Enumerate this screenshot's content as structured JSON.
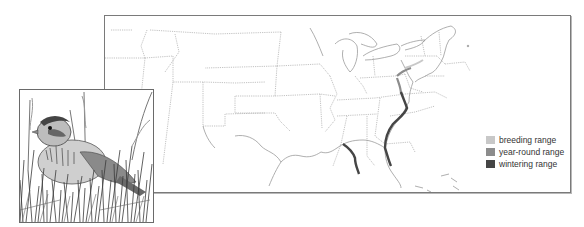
{
  "figure": {
    "type": "species range map with illustration",
    "map_region": "Eastern United States",
    "illustration": "sparrow perched among marsh grasses"
  },
  "legend": {
    "items": [
      {
        "label": "breeding range",
        "color": "#c8c8c8"
      },
      {
        "label": "year-round range",
        "color": "#8c8c8c"
      },
      {
        "label": "wintering range",
        "color": "#454545"
      }
    ]
  },
  "colors": {
    "frame": "#7a7a7a",
    "state_border": "#a8a8a8",
    "coast": "#9a9a9a"
  }
}
